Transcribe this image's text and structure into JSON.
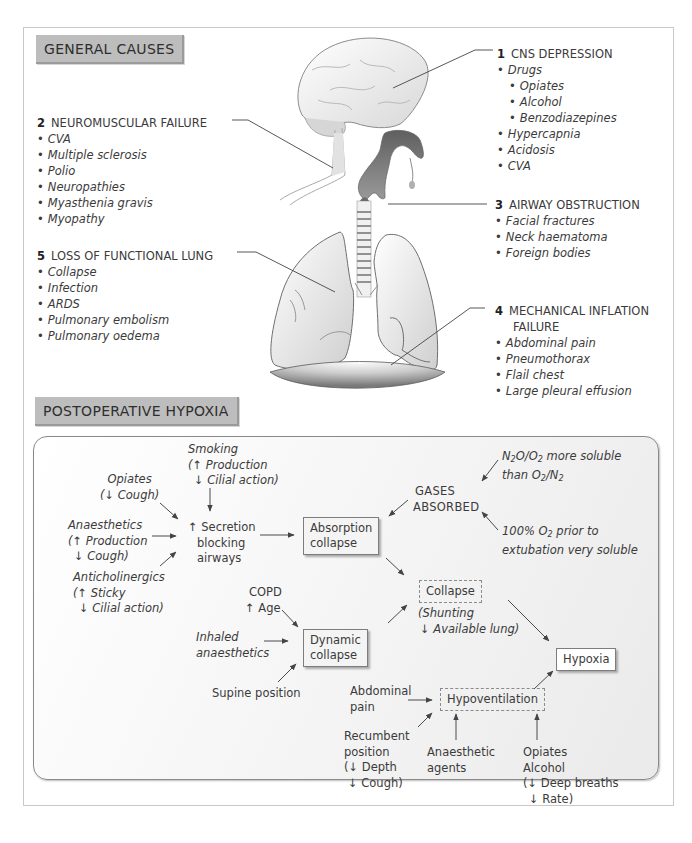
{
  "sections": {
    "general_causes_label": "GENERAL CAUSES",
    "postoperative_label": "POSTOPERATIVE HYPOXIA"
  },
  "general_causes": [
    {
      "number": "1",
      "title": "CNS DEPRESSION",
      "items": [
        {
          "label": "Drugs",
          "level": 0
        },
        {
          "label": "Opiates",
          "level": 1
        },
        {
          "label": "Alcohol",
          "level": 1
        },
        {
          "label": "Benzodiazepines",
          "level": 1
        },
        {
          "label": "Hypercapnia",
          "level": 0
        },
        {
          "label": "Acidosis",
          "level": 0
        },
        {
          "label": "CVA",
          "level": 0
        }
      ]
    },
    {
      "number": "2",
      "title": "NEUROMUSCULAR FAILURE",
      "items": [
        {
          "label": "CVA"
        },
        {
          "label": "Multiple sclerosis"
        },
        {
          "label": "Polio"
        },
        {
          "label": "Neuropathies"
        },
        {
          "label": "Myasthenia gravis"
        },
        {
          "label": "Myopathy"
        }
      ]
    },
    {
      "number": "3",
      "title": "AIRWAY OBSTRUCTION",
      "items": [
        {
          "label": "Facial fractures"
        },
        {
          "label": "Neck haematoma"
        },
        {
          "label": "Foreign bodies"
        }
      ]
    },
    {
      "number": "4",
      "title_line1": "MECHANICAL INFLATION",
      "title_line2": "FAILURE",
      "items": [
        {
          "label": "Abdominal pain"
        },
        {
          "label": "Pneumothorax"
        },
        {
          "label": "Flail chest"
        },
        {
          "label": "Large pleural effusion"
        }
      ]
    },
    {
      "number": "5",
      "title": "LOSS OF FUNCTIONAL LUNG",
      "items": [
        {
          "label": "Collapse"
        },
        {
          "label": "Infection"
        },
        {
          "label": "ARDS"
        },
        {
          "label": "Pulmonary embolism"
        },
        {
          "label": "Pulmonary oedema"
        }
      ]
    }
  ],
  "illustration": {
    "parts": [
      "brain-icon",
      "upper-airway-icon",
      "trachea-icon",
      "lungs-icon",
      "diaphragm-icon"
    ]
  },
  "flow": {
    "opiates": {
      "line1": "Opiates",
      "line2": "(↓ Cough)"
    },
    "smoking": {
      "line1": "Smoking",
      "line2": "(↑ Production",
      "line3": "↓ Cilial action)"
    },
    "anaesthetics": {
      "line1": "Anaesthetics",
      "line2": "(↑ Production",
      "line3": "↓ Cough)"
    },
    "anticholinergics": {
      "line1": "Anticholinergics",
      "line2": "(↑ Sticky",
      "line3": "↓ Cilial action)"
    },
    "secretion": {
      "line1": "↑ Secretion",
      "line2": "blocking",
      "line3": "airways"
    },
    "absorption_collapse": {
      "line1": "Absorption",
      "line2": "collapse"
    },
    "gases_absorbed": {
      "line1": "GASES",
      "line2": "ABSORBED"
    },
    "n2o": {
      "line1_a": "N",
      "line1_sub1": "2",
      "line1_b": "O/O",
      "line1_sub2": "2",
      "line1_c": " more soluble",
      "line2_a": "than O",
      "line2_sub1": "2",
      "line2_b": "/N",
      "line2_sub2": "2"
    },
    "oxygen100": {
      "line1_a": "100% O",
      "line1_sub": "2",
      "line1_b": " prior to",
      "line2": "extubation very soluble"
    },
    "copd": {
      "line1": "COPD",
      "line2": "↑ Age"
    },
    "inhaled": {
      "line1": "Inhaled",
      "line2": "anaesthetics"
    },
    "supine": "Supine position",
    "dynamic_collapse": {
      "line1": "Dynamic",
      "line2": "collapse"
    },
    "collapse": "Collapse",
    "shunting": {
      "line1": "(Shunting",
      "line2": "↓ Available lung)"
    },
    "hypoxia": "Hypoxia",
    "abdominal_pain": {
      "line1": "Abdominal",
      "line2": "pain"
    },
    "hypoventilation": "Hypoventilation",
    "recumbent": {
      "line1": "Recumbent",
      "line2": "position",
      "line3": "(↓ Depth",
      "line4": "↓ Cough)"
    },
    "anaesthetic_agents": {
      "line1": "Anaesthetic",
      "line2": "agents"
    },
    "opiates_alcohol": {
      "line1": "Opiates",
      "line2": "Alcohol",
      "line3": "(↓ Deep breaths",
      "line4": "↓ Rate)"
    }
  },
  "colors": {
    "label_bg": "#bdbdbd",
    "text": "#3b3b3b",
    "line": "#555555",
    "frame": "#c9c9c9"
  }
}
